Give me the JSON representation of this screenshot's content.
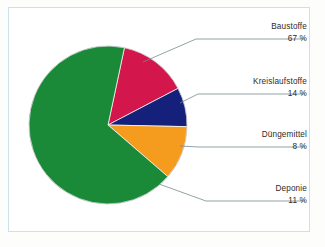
{
  "figure": {
    "background_color": "#fdfdfc",
    "frame_color": "#cfe1e8",
    "text_color": "#2b2b2b",
    "leader_color": "#7a8a91"
  },
  "chart_data": {
    "type": "pie",
    "title": "",
    "xlabel": "",
    "ylabel": "",
    "legend_position": "callout-right",
    "grid": false,
    "start_angle_deg": 12,
    "direction": "clockwise",
    "unit": "%",
    "categories": [
      "Baustoffe",
      "Kreislaufstoffe",
      "Düngemittel",
      "Deponie"
    ],
    "values": [
      67,
      14,
      8,
      11
    ],
    "value_labels": [
      "67 %",
      "14 %",
      "8 %",
      "11 %"
    ],
    "colors": [
      "#1a8a38",
      "#d3164b",
      "#15207a",
      "#f59b1e"
    ],
    "slices": [
      {
        "label": "Baustoffe",
        "value": 67,
        "value_label": "67 %",
        "color": "#1a8a38"
      },
      {
        "label": "Kreislaufstoffe",
        "value": 14,
        "value_label": "14 %",
        "color": "#d3164b"
      },
      {
        "label": "Düngemittel",
        "value": 8,
        "value_label": "8 %",
        "color": "#15207a"
      },
      {
        "label": "Deponie",
        "value": 11,
        "value_label": "11 %",
        "color": "#f59b1e"
      }
    ]
  }
}
